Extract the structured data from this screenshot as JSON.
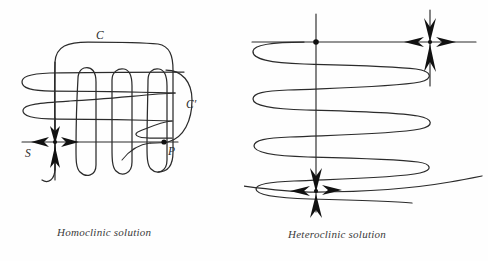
{
  "figure": {
    "background_color": "#fefefe",
    "stroke_color": "#2b2b2b",
    "label_color": "#2a2a2a"
  },
  "panels": [
    {
      "id": "homoclinic",
      "caption": "Homoclinic solution",
      "labels": {
        "C": "C",
        "C_prime": "C′",
        "P": "P",
        "S": "S"
      },
      "features": {
        "saddle_point_name": "S",
        "intersection_point_name": "P",
        "stable_manifold": "C",
        "unstable_manifold": "C′",
        "lobe_count": 3,
        "left_lobe_count": 2
      }
    },
    {
      "id": "heteroclinic",
      "caption": "Heteroclinic solution",
      "labels": {
        "Q": "Q",
        "D_prime": "D′",
        "S_prime": "S′",
        "D": "D",
        "S": "S",
        "C_prime": "C′"
      },
      "features": {
        "saddle_point_lower_name": "S",
        "saddle_point_upper_name": "S′",
        "intersection_point_name": "Q",
        "manifold_D_prime": "D′",
        "manifold_D": "D",
        "manifold_C_prime": "C′",
        "oscillation_count": 6
      }
    }
  ]
}
